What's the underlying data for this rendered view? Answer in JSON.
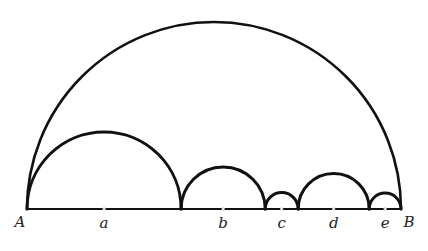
{
  "diagram": {
    "endpoints": {
      "left": "A",
      "right": "B"
    },
    "segments": [
      {
        "label": "a",
        "fraction": 0.412
      },
      {
        "label": "b",
        "fraction": 0.225
      },
      {
        "label": "c",
        "fraction": 0.088
      },
      {
        "label": "d",
        "fraction": 0.19
      },
      {
        "label": "e",
        "fraction": 0.085
      }
    ],
    "colors": {
      "stroke": "#111111",
      "label": "#222222",
      "background": "#ffffff"
    }
  }
}
